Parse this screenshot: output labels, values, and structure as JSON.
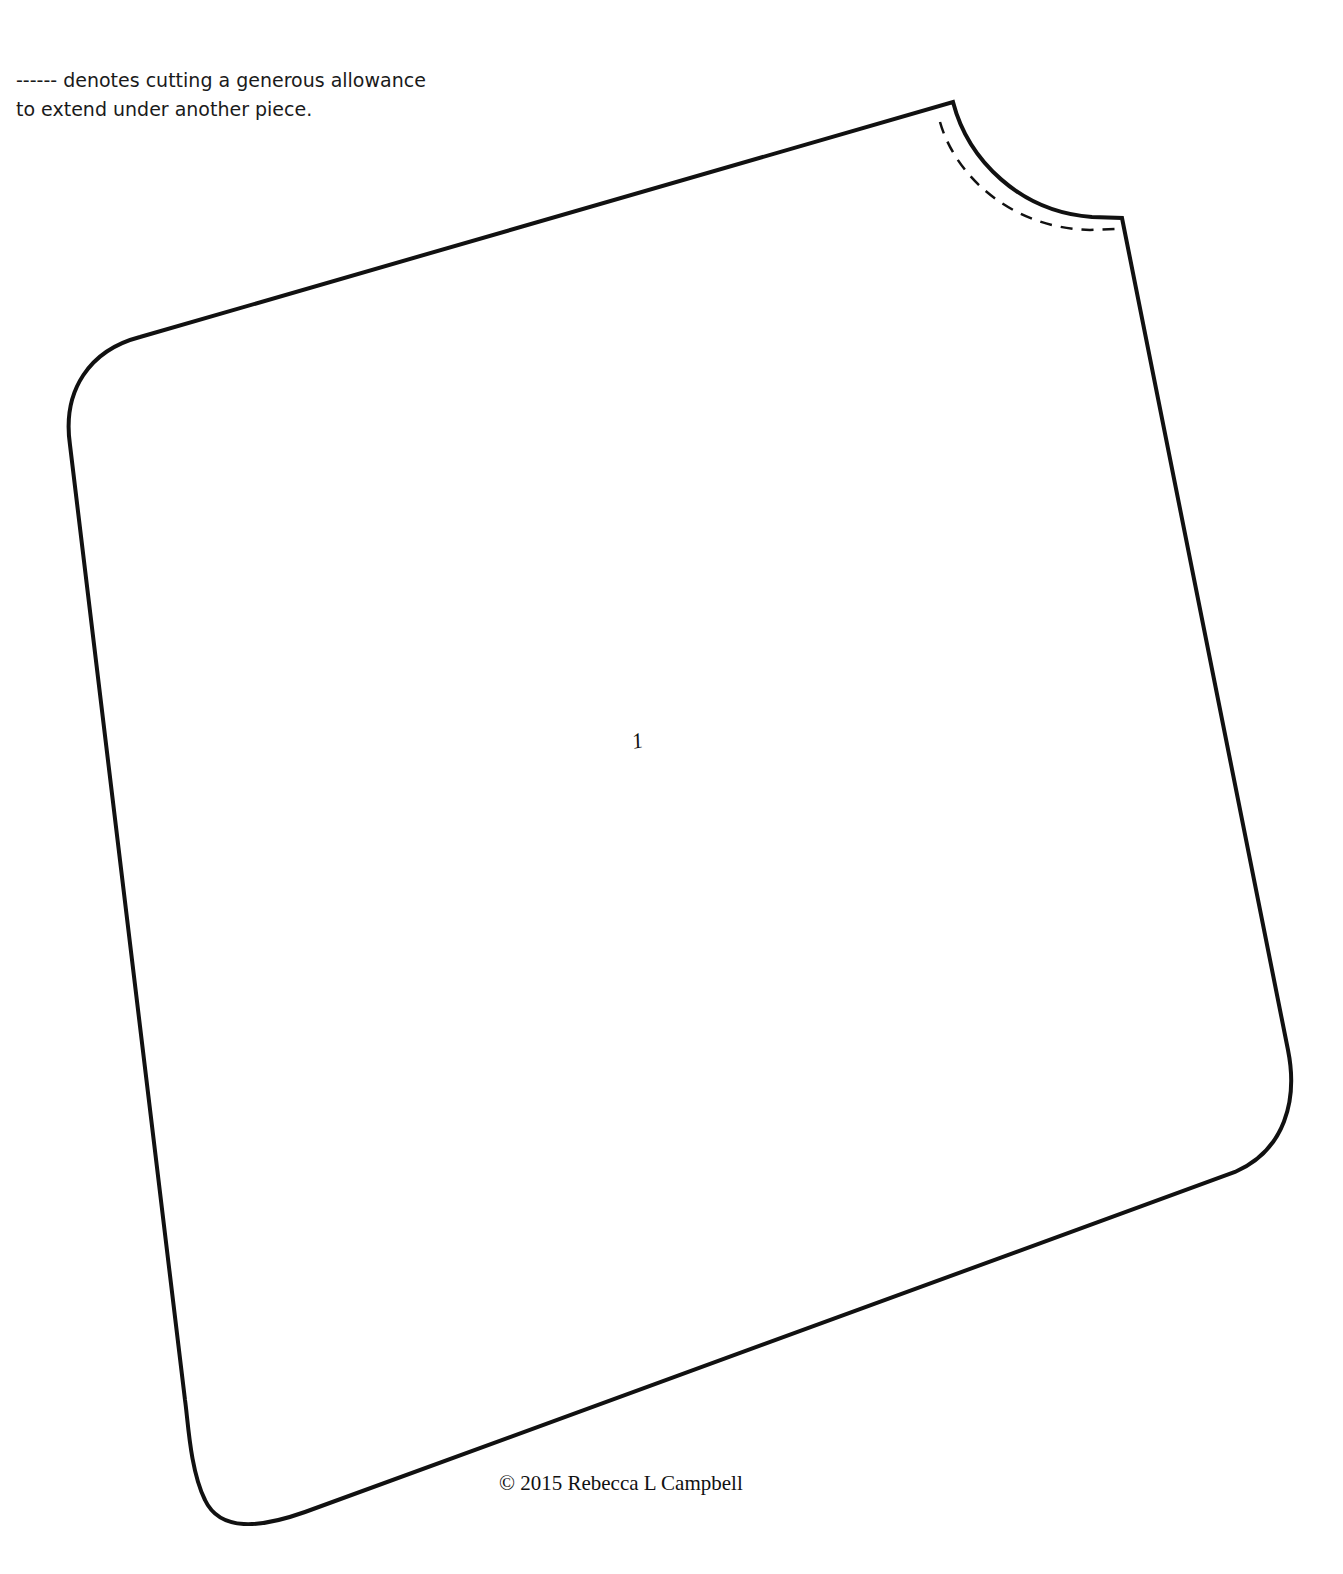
{
  "note": {
    "line1": "------ denotes cutting a generous allowance",
    "line2": "to extend under another piece."
  },
  "piece": {
    "label": "1",
    "outline_color": "#111111",
    "dash_legend": "------"
  },
  "footer": {
    "copyright": "© 2015 Rebecca L Campbell"
  }
}
